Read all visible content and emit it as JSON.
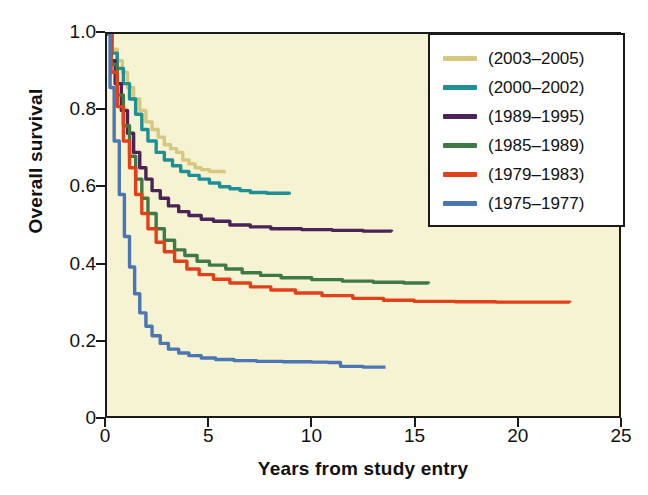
{
  "chart_data": {
    "type": "line",
    "title": "",
    "subtitle": "",
    "xlabel": "Years from study entry",
    "ylabel": "Overall survival",
    "xlim": [
      0,
      25
    ],
    "ylim": [
      0,
      1.0
    ],
    "xticks": [
      "0",
      "5",
      "10",
      "15",
      "20",
      "25"
    ],
    "xtick_values": [
      0,
      5,
      10,
      15,
      20,
      25
    ],
    "yticks": [
      "0",
      "0.2",
      "0.4",
      "0.6",
      "0.8",
      "1.0"
    ],
    "ytick_values": [
      0,
      0.2,
      0.4,
      0.6,
      0.8,
      1.0
    ],
    "grid": false,
    "legend_position": "top-right",
    "plot_background": "#f6f3d2",
    "legend_background": "#ffffff",
    "axis_color": "#1a1a1a",
    "curve_style": "kaplan-meier step function",
    "series": [
      {
        "name": "(2003–2005)",
        "color": "#d6c87f",
        "x": [
          0,
          0.25,
          0.5,
          0.75,
          1.0,
          1.3,
          1.6,
          1.9,
          2.2,
          2.5,
          2.8,
          3.1,
          3.4,
          3.7,
          4.0,
          4.3,
          4.6,
          5.0,
          5.4,
          5.8
        ],
        "y": [
          1.0,
          0.96,
          0.93,
          0.9,
          0.86,
          0.83,
          0.8,
          0.77,
          0.75,
          0.73,
          0.71,
          0.7,
          0.69,
          0.67,
          0.66,
          0.65,
          0.645,
          0.64,
          0.64,
          0.64
        ]
      },
      {
        "name": "(2000–2002)",
        "color": "#1f8f96",
        "x": [
          0,
          0.25,
          0.5,
          0.8,
          1.1,
          1.4,
          1.7,
          2.0,
          2.4,
          2.8,
          3.2,
          3.6,
          4.0,
          4.5,
          5.0,
          5.5,
          6.0,
          6.5,
          7.0,
          7.8,
          8.9
        ],
        "y": [
          1.0,
          0.95,
          0.91,
          0.87,
          0.83,
          0.79,
          0.75,
          0.72,
          0.69,
          0.67,
          0.655,
          0.64,
          0.63,
          0.62,
          0.61,
          0.6,
          0.595,
          0.59,
          0.585,
          0.583,
          0.58
        ]
      },
      {
        "name": "(1989–1995)",
        "color": "#4b2357",
        "x": [
          0,
          0.2,
          0.4,
          0.7,
          1.0,
          1.3,
          1.6,
          1.9,
          2.2,
          2.6,
          3.0,
          3.5,
          4.0,
          4.6,
          5.2,
          6.0,
          7.0,
          8.0,
          9.5,
          11.0,
          12.5,
          13.9
        ],
        "y": [
          1.0,
          0.93,
          0.87,
          0.8,
          0.74,
          0.69,
          0.65,
          0.62,
          0.59,
          0.57,
          0.55,
          0.535,
          0.525,
          0.515,
          0.51,
          0.5,
          0.495,
          0.49,
          0.488,
          0.486,
          0.484,
          0.483
        ]
      },
      {
        "name": "(1985–1989)",
        "color": "#3f7a46",
        "x": [
          0,
          0.2,
          0.5,
          0.8,
          1.1,
          1.4,
          1.7,
          2.0,
          2.4,
          2.8,
          3.3,
          3.8,
          4.4,
          5.0,
          5.8,
          6.6,
          7.5,
          8.5,
          10.0,
          11.5,
          13.0,
          14.5,
          15.7
        ],
        "y": [
          1.0,
          0.92,
          0.84,
          0.76,
          0.68,
          0.62,
          0.57,
          0.53,
          0.49,
          0.46,
          0.435,
          0.42,
          0.405,
          0.395,
          0.385,
          0.375,
          0.368,
          0.362,
          0.357,
          0.353,
          0.35,
          0.348,
          0.347
        ]
      },
      {
        "name": "(1979–1983)",
        "color": "#e0401a",
        "x": [
          0,
          0.2,
          0.5,
          0.8,
          1.1,
          1.4,
          1.7,
          2.0,
          2.4,
          2.8,
          3.3,
          3.9,
          4.5,
          5.2,
          6.0,
          7.0,
          8.0,
          9.2,
          10.5,
          12.0,
          13.5,
          15.0,
          17.0,
          19.0,
          21.0,
          22.6
        ],
        "y": [
          1.0,
          0.9,
          0.81,
          0.72,
          0.65,
          0.58,
          0.53,
          0.49,
          0.455,
          0.43,
          0.405,
          0.385,
          0.37,
          0.358,
          0.348,
          0.338,
          0.33,
          0.322,
          0.315,
          0.308,
          0.303,
          0.3,
          0.299,
          0.298,
          0.298,
          0.297
        ]
      },
      {
        "name": "(1975–1977)",
        "color": "#4a77b4",
        "x": [
          0,
          0.15,
          0.35,
          0.6,
          0.85,
          1.1,
          1.35,
          1.6,
          1.9,
          2.2,
          2.6,
          3.0,
          3.5,
          4.0,
          4.6,
          5.3,
          6.2,
          7.3,
          8.6,
          10.0,
          10.8,
          11.4,
          12.5,
          13.6
        ],
        "y": [
          1.0,
          0.86,
          0.72,
          0.58,
          0.47,
          0.39,
          0.32,
          0.27,
          0.235,
          0.21,
          0.19,
          0.175,
          0.165,
          0.158,
          0.152,
          0.148,
          0.145,
          0.143,
          0.142,
          0.141,
          0.14,
          0.13,
          0.128,
          0.128
        ]
      }
    ]
  },
  "legend": {
    "items": [
      {
        "label": "(2003–2005)",
        "color": "#d6c87f"
      },
      {
        "label": "(2000–2002)",
        "color": "#1f8f96"
      },
      {
        "label": "(1989–1995)",
        "color": "#4b2357"
      },
      {
        "label": "(1985–1989)",
        "color": "#3f7a46"
      },
      {
        "label": "(1979–1983)",
        "color": "#e0401a"
      },
      {
        "label": "(1975–1977)",
        "color": "#4a77b4"
      }
    ]
  }
}
